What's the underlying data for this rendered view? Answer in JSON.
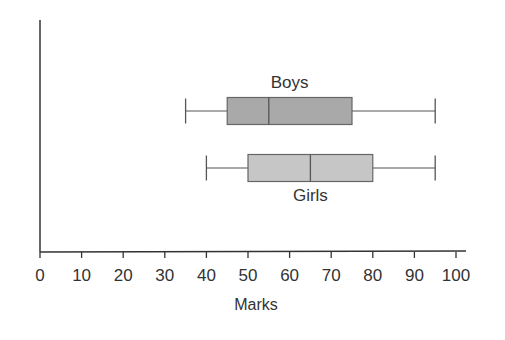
{
  "chart_data": {
    "type": "boxplot",
    "title": "",
    "xlabel": "Marks",
    "ylabel": "",
    "xlim": [
      0,
      100
    ],
    "x_ticks": [
      0,
      10,
      20,
      30,
      40,
      50,
      60,
      70,
      80,
      90,
      100
    ],
    "grid": false,
    "orientation": "horizontal",
    "series": [
      {
        "name": "Boys",
        "min": 35,
        "q1": 45,
        "median": 55,
        "q3": 75,
        "max": 95,
        "color": "#a9a9a9",
        "label_position": "above"
      },
      {
        "name": "Girls",
        "min": 40,
        "q1": 50,
        "median": 65,
        "q3": 80,
        "max": 95,
        "color": "#c6c6c6",
        "label_position": "below"
      }
    ]
  },
  "axis": {
    "stroke": "#333333"
  }
}
